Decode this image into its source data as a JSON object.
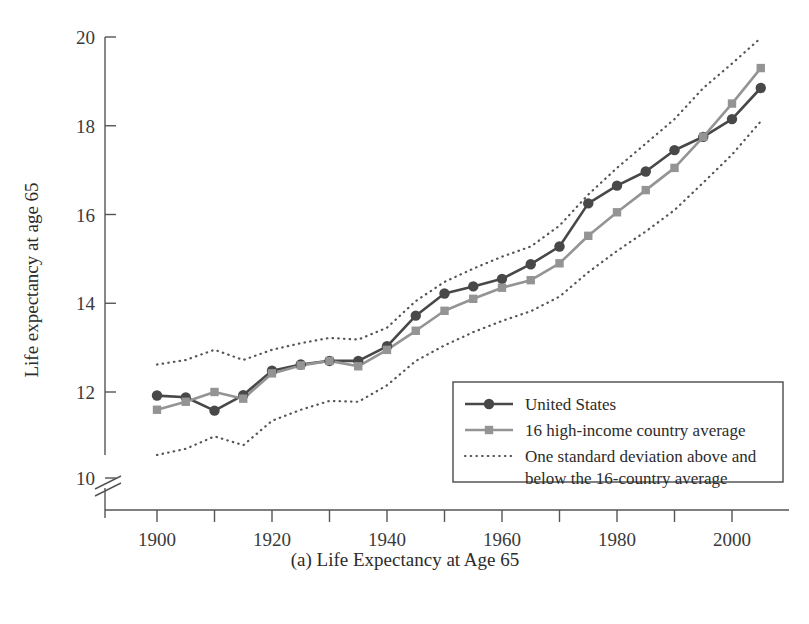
{
  "chart_data": {
    "type": "line",
    "title": "",
    "caption": "(a) Life Expectancy at Age 65",
    "xlabel": "",
    "ylabel": "Life expectancy at age 65",
    "xlim": [
      1890,
      2010
    ],
    "ylim": [
      9.6,
      20
    ],
    "y_axis_break": true,
    "y_break_label": "10",
    "grid": false,
    "legend_position": "bottom-right",
    "xticks": [
      1890,
      1900,
      1910,
      1920,
      1930,
      1940,
      1950,
      1960,
      1970,
      1980,
      1990,
      2000,
      2010
    ],
    "xticklabels": [
      "",
      "1900",
      "",
      "1920",
      "",
      "1940",
      "",
      "1960",
      "",
      "1980",
      "",
      "2000",
      ""
    ],
    "yticks": [
      10,
      12,
      14,
      16,
      18,
      20
    ],
    "yticklabels": [
      "10",
      "12",
      "14",
      "16",
      "18",
      "20"
    ],
    "x": [
      1900,
      1905,
      1910,
      1915,
      1920,
      1925,
      1930,
      1935,
      1940,
      1945,
      1950,
      1955,
      1960,
      1965,
      1970,
      1975,
      1980,
      1985,
      1990,
      1995,
      2000,
      2005
    ],
    "series": [
      {
        "name": "United States",
        "color": "#484848",
        "marker": "circle",
        "style": "solid",
        "values": [
          11.92,
          11.88,
          11.58,
          11.93,
          12.48,
          12.62,
          12.7,
          12.7,
          13.03,
          13.72,
          14.22,
          14.38,
          14.55,
          14.88,
          15.28,
          16.25,
          16.65,
          16.97,
          17.45,
          17.75,
          18.15,
          18.85
        ]
      },
      {
        "name": "16 high-income country average",
        "color": "#949494",
        "marker": "square",
        "style": "solid",
        "values": [
          11.6,
          11.78,
          12.0,
          11.85,
          12.42,
          12.6,
          12.7,
          12.58,
          12.95,
          13.38,
          13.83,
          14.1,
          14.35,
          14.52,
          14.9,
          15.52,
          16.05,
          16.55,
          17.05,
          17.75,
          18.5,
          19.3
        ]
      },
      {
        "name": "One standard deviation above the 16-country average",
        "color": "#555555",
        "marker": "none",
        "style": "dotted",
        "values": [
          12.62,
          12.72,
          12.95,
          12.72,
          12.95,
          13.1,
          13.22,
          13.18,
          13.45,
          14.05,
          14.48,
          14.78,
          15.05,
          15.28,
          15.75,
          16.45,
          17.05,
          17.6,
          18.15,
          18.85,
          19.4,
          19.98
        ]
      },
      {
        "name": "One standard deviation below the 16-country average",
        "color": "#555555",
        "marker": "none",
        "style": "dotted",
        "values": [
          10.58,
          10.72,
          11.0,
          10.8,
          11.35,
          11.6,
          11.8,
          11.78,
          12.15,
          12.7,
          13.05,
          13.35,
          13.6,
          13.82,
          14.15,
          14.7,
          15.18,
          15.62,
          16.1,
          16.72,
          17.35,
          18.1
        ]
      }
    ],
    "legend": [
      {
        "label": "United States",
        "swatch": "solid-circle",
        "color": "#484848"
      },
      {
        "label": "16 high-income country average",
        "swatch": "solid-square",
        "color": "#949494"
      },
      {
        "label": "One standard deviation above and",
        "label2": "below the 16-country average",
        "swatch": "dotted",
        "color": "#555555"
      }
    ]
  }
}
